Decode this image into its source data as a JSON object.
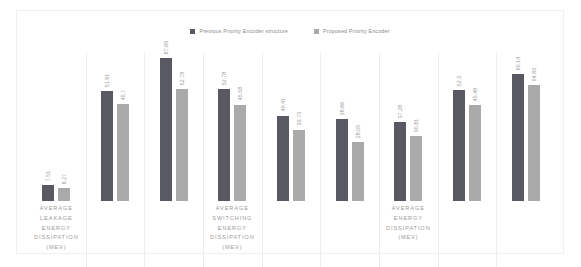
{
  "chart_data": {
    "type": "bar",
    "title": "",
    "xlabel": "",
    "ylabel": "",
    "grid": false,
    "legend_position": "top-center",
    "ylim": [
      0,
      70
    ],
    "categories": [
      "AVERAGE LEAKAGE ENERGY DISSIPATION (MEV)",
      "",
      "",
      "AVERAGE SWITCHING ENERGY DISSIPATION (MEV)",
      "",
      "",
      "AVERAGE ENERGY DISSIPATION (MEV)",
      "",
      ""
    ],
    "series": [
      {
        "name": "Previous Priority Encoder structure",
        "color": "#595963",
        "values": [
          7.51,
          51.91,
          67.69,
          52.78,
          40.41,
          38.66,
          37.28,
          52.3,
          60.14
        ]
      },
      {
        "name": "Proposed Priority Encoder",
        "color": "#aaaaaa",
        "values": [
          6.27,
          45.7,
          52.78,
          45.58,
          33.73,
          28.05,
          30.81,
          45.49,
          54.83
        ]
      }
    ],
    "value_label_texts": {
      "previous": [
        "7.51",
        "51.91",
        "67.69",
        "52.78",
        "40.41",
        "38.66",
        "37.28",
        "52.3",
        "60.14"
      ],
      "proposed": [
        "6.27",
        "45.7",
        "52.78",
        "45.58",
        "33.73",
        "28.05",
        "30.81",
        "45.49",
        "54.83"
      ]
    }
  },
  "legend": {
    "items": [
      {
        "label": "Previous Priority Encoder structure",
        "color": "#595963"
      },
      {
        "label": "Proposed Priority Encoder",
        "color": "#aaaaaa"
      }
    ]
  },
  "axis_labels": [
    {
      "lines": [
        "AVERAGE",
        "LEAKAGE",
        "ENERGY",
        "DISSIPATION",
        "(MEV)"
      ]
    },
    {
      "lines": [
        "AVERAGE",
        "SWITCHING",
        "ENERGY",
        "DISSIPATION",
        "(MEV)"
      ]
    },
    {
      "lines": [
        "AVERAGE",
        "ENERGY",
        "DISSIPATION",
        "(MEV)"
      ]
    }
  ]
}
